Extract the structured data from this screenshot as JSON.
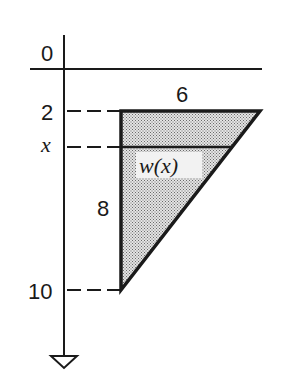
{
  "diagram": {
    "type": "triangular plate submerged below surface (depth axis)",
    "axis": {
      "direction": "downward",
      "tick_labels": [
        "0",
        "2",
        "x",
        "10"
      ],
      "surface_label": "0"
    },
    "labels": {
      "surface_depth": "0",
      "top_depth": "2",
      "variable_depth": "x",
      "bottom_depth": "10",
      "top_width": "6",
      "height": "8",
      "strip_width": "w(x)"
    },
    "shape": {
      "kind": "right triangle",
      "top_width": 6,
      "height": 8,
      "top_depth": 2,
      "bottom_depth": 10,
      "fill": "stippled gray"
    },
    "colors": {
      "ink": "#1a1a1a",
      "fill": "#bdbdbd",
      "background": "#ffffff"
    }
  }
}
